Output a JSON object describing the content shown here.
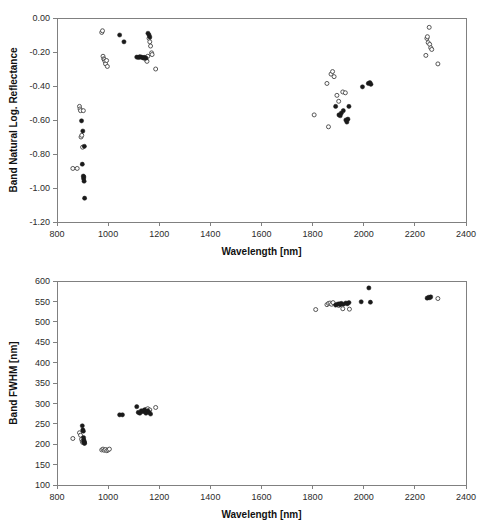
{
  "chart_data": [
    {
      "id": "band-natural-log-reflectance",
      "type": "scatter",
      "title": "",
      "xlabel": "Wavelength [nm]",
      "ylabel": "Band Natural Log. Reflectance",
      "xlim": [
        800,
        2400
      ],
      "ylim": [
        -1.2,
        0.0
      ],
      "xticks": [
        800,
        1000,
        1200,
        1400,
        1600,
        1800,
        2000,
        2200,
        2400
      ],
      "xticklabels": [
        "800",
        "1000",
        "1200",
        "1400",
        "1600",
        "1800",
        "2000",
        "2200",
        "2400"
      ],
      "yticks": [
        0.0,
        -0.2,
        -0.4,
        -0.6,
        -0.8,
        -1.0,
        -1.2
      ],
      "yticklabels": [
        "0.00",
        "-0.20",
        "-0.40",
        "-0.60",
        "-0.80",
        "-1.00",
        "-1.20"
      ],
      "grid": false,
      "legend": "none",
      "series": [
        {
          "name": "open-markers",
          "marker": "open-circle",
          "color": "#444444",
          "points": [
            [
              862,
              -0.885
            ],
            [
              879,
              -0.885
            ],
            [
              888,
              -0.52
            ],
            [
              890,
              -0.535
            ],
            [
              892,
              -0.545
            ],
            [
              894,
              -0.7
            ],
            [
              897,
              -0.69
            ],
            [
              900,
              -0.76
            ],
            [
              903,
              -0.545
            ],
            [
              975,
              -0.085
            ],
            [
              978,
              -0.075
            ],
            [
              980,
              -0.225
            ],
            [
              983,
              -0.24
            ],
            [
              985,
              -0.245
            ],
            [
              988,
              -0.255
            ],
            [
              990,
              -0.27
            ],
            [
              994,
              -0.25
            ],
            [
              997,
              -0.285
            ],
            [
              1124,
              -0.23
            ],
            [
              1140,
              -0.235
            ],
            [
              1148,
              -0.245
            ],
            [
              1152,
              -0.255
            ],
            [
              1155,
              -0.225
            ],
            [
              1160,
              -0.12
            ],
            [
              1163,
              -0.14
            ],
            [
              1166,
              -0.165
            ],
            [
              1170,
              -0.205
            ],
            [
              1172,
              -0.215
            ],
            [
              1186,
              -0.3
            ],
            [
              1806,
              -0.57
            ],
            [
              1856,
              -0.385
            ],
            [
              1862,
              -0.64
            ],
            [
              1872,
              -0.33
            ],
            [
              1878,
              -0.315
            ],
            [
              1884,
              -0.345
            ],
            [
              1895,
              -0.455
            ],
            [
              1902,
              -0.49
            ],
            [
              1918,
              -0.435
            ],
            [
              1928,
              -0.44
            ],
            [
              2243,
              -0.22
            ],
            [
              2247,
              -0.12
            ],
            [
              2249,
              -0.11
            ],
            [
              2252,
              -0.145
            ],
            [
              2256,
              -0.055
            ],
            [
              2258,
              -0.155
            ],
            [
              2262,
              -0.175
            ],
            [
              2266,
              -0.185
            ],
            [
              2290,
              -0.27
            ]
          ]
        },
        {
          "name": "filled-markers",
          "marker": "filled-circle",
          "color": "#1a1a1a",
          "points": [
            [
              896,
              -0.605
            ],
            [
              899,
              -0.86
            ],
            [
              901,
              -0.665
            ],
            [
              903,
              -0.93
            ],
            [
              904,
              -0.945
            ],
            [
              905,
              -0.935
            ],
            [
              906,
              -0.96
            ],
            [
              907,
              -0.755
            ],
            [
              908,
              -1.06
            ],
            [
              1045,
              -0.1
            ],
            [
              1062,
              -0.14
            ],
            [
              1112,
              -0.23
            ],
            [
              1118,
              -0.232
            ],
            [
              1124,
              -0.228
            ],
            [
              1130,
              -0.23
            ],
            [
              1136,
              -0.234
            ],
            [
              1142,
              -0.232
            ],
            [
              1148,
              -0.236
            ],
            [
              1156,
              -0.09
            ],
            [
              1160,
              -0.1
            ],
            [
              1163,
              -0.112
            ],
            [
              1890,
              -0.52
            ],
            [
              1903,
              -0.57
            ],
            [
              1908,
              -0.575
            ],
            [
              1912,
              -0.56
            ],
            [
              1920,
              -0.545
            ],
            [
              1930,
              -0.6
            ],
            [
              1934,
              -0.612
            ],
            [
              1938,
              -0.595
            ],
            [
              1942,
              -0.52
            ],
            [
              1995,
              -0.405
            ],
            [
              2018,
              -0.385
            ],
            [
              2024,
              -0.38
            ],
            [
              2028,
              -0.39
            ]
          ]
        }
      ]
    },
    {
      "id": "band-fwhm",
      "type": "scatter",
      "title": "",
      "xlabel": "Wavelength [nm]",
      "ylabel": "Band FWHM [nm]",
      "xlim": [
        800,
        2400
      ],
      "ylim": [
        100,
        600
      ],
      "xticks": [
        800,
        1000,
        1200,
        1400,
        1600,
        1800,
        2000,
        2200,
        2400
      ],
      "xticklabels": [
        "800",
        "1000",
        "1200",
        "1400",
        "1600",
        "1800",
        "2000",
        "2200",
        "2400"
      ],
      "yticks": [
        100,
        150,
        200,
        250,
        300,
        350,
        400,
        450,
        500,
        550,
        600
      ],
      "yticklabels": [
        "100",
        "150",
        "200",
        "250",
        "300",
        "350",
        "400",
        "450",
        "500",
        "550",
        "600"
      ],
      "grid": false,
      "legend": "none",
      "series": [
        {
          "name": "open-markers",
          "marker": "open-circle",
          "color": "#444444",
          "points": [
            [
              862,
              214
            ],
            [
              888,
              228
            ],
            [
              892,
              222
            ],
            [
              896,
              212
            ],
            [
              899,
              207
            ],
            [
              901,
              204
            ],
            [
              904,
              206
            ],
            [
              906,
              203
            ],
            [
              975,
              186
            ],
            [
              980,
              188
            ],
            [
              985,
              185
            ],
            [
              990,
              187
            ],
            [
              995,
              184
            ],
            [
              1000,
              186
            ],
            [
              1005,
              188
            ],
            [
              1148,
              285
            ],
            [
              1155,
              287
            ],
            [
              1163,
              284
            ],
            [
              1186,
              290
            ],
            [
              1812,
              530
            ],
            [
              1856,
              542
            ],
            [
              1862,
              545
            ],
            [
              1868,
              546
            ],
            [
              1874,
              543
            ],
            [
              1880,
              547
            ],
            [
              1902,
              540
            ],
            [
              1918,
              532
            ],
            [
              1944,
              531
            ],
            [
              2290,
              557
            ]
          ]
        },
        {
          "name": "filled-markers",
          "marker": "filled-circle",
          "color": "#1a1a1a",
          "points": [
            [
              899,
              245
            ],
            [
              901,
              235
            ],
            [
              903,
              232
            ],
            [
              904,
              216
            ],
            [
              905,
              210
            ],
            [
              906,
              207
            ],
            [
              907,
              205
            ],
            [
              908,
              202
            ],
            [
              1045,
              272
            ],
            [
              1056,
              272
            ],
            [
              1112,
              292
            ],
            [
              1118,
              278
            ],
            [
              1124,
              276
            ],
            [
              1130,
              282
            ],
            [
              1136,
              280
            ],
            [
              1142,
              284
            ],
            [
              1148,
              276
            ],
            [
              1155,
              282
            ],
            [
              1160,
              278
            ],
            [
              1166,
              274
            ],
            [
              1890,
              541
            ],
            [
              1896,
              543
            ],
            [
              1903,
              544
            ],
            [
              1908,
              542
            ],
            [
              1912,
              545
            ],
            [
              1920,
              543
            ],
            [
              1930,
              546
            ],
            [
              1936,
              544
            ],
            [
              1942,
              547
            ],
            [
              1990,
              549
            ],
            [
              2020,
              583
            ],
            [
              2026,
              548
            ],
            [
              2248,
              558
            ],
            [
              2254,
              560
            ],
            [
              2258,
              559
            ],
            [
              2262,
              561
            ]
          ]
        }
      ]
    }
  ]
}
